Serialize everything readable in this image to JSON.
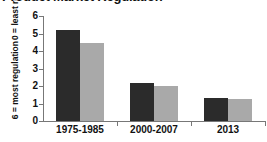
{
  "chart_data": {
    "type": "bar",
    "title": "Product Market Regulation",
    "xlabel": "",
    "ylabel": "6 = most regulation  0 = least regulation",
    "ylabel_lines": [
      "6 = most regulation",
      "0 = least regulation"
    ],
    "categories": [
      "1975-1985",
      "2000-2007",
      "2013"
    ],
    "series": [
      {
        "name": "series-1",
        "color": "#2b2b2b",
        "values": [
          5.2,
          2.2,
          1.3
        ]
      },
      {
        "name": "series-2",
        "color": "#a9a9a9",
        "values": [
          4.45,
          2.0,
          1.25
        ]
      }
    ],
    "ylim": [
      0,
      6
    ],
    "yticks": [
      0,
      1,
      2,
      3,
      4,
      5,
      6
    ],
    "ytick_labels": [
      "0",
      "1",
      "2",
      "3",
      "4",
      "5",
      "6"
    ],
    "grid": false,
    "legend": "none",
    "axis_color": "#777777"
  }
}
